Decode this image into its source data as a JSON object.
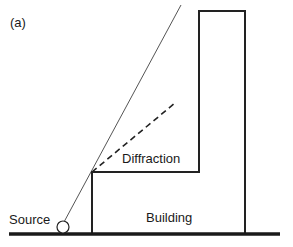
{
  "figure": {
    "panel_label": "(a)",
    "labels": {
      "source": "Source",
      "building": "Building",
      "diffraction": "Diffraction"
    },
    "colors": {
      "stroke": "#222222",
      "ray": "#555555",
      "background": "#ffffff"
    }
  }
}
